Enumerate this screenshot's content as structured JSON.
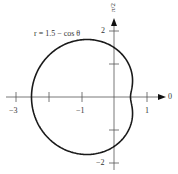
{
  "chart_data": {
    "type": "line",
    "title": "",
    "equation_label": "r = 1.5 − cos θ",
    "coordinate_system": "polar",
    "function": "r = 1.5 - cos(theta)",
    "theta_range": [
      0,
      6.283185
    ],
    "x_ticks": [
      -3,
      -2,
      -1,
      1
    ],
    "x_tick_labels": [
      "−3",
      "−1",
      "1"
    ],
    "x_tick_labels_positions": [
      -3,
      -1,
      1
    ],
    "y_ticks": [
      -2,
      -1,
      1,
      2
    ],
    "y_tick_labels": [
      "−2",
      "2"
    ],
    "y_tick_labels_positions": [
      -2,
      2
    ],
    "x_axis_end_label": "0",
    "y_axis_end_label": "π/2",
    "xlim": [
      -3.2,
      1.6
    ],
    "ylim": [
      -2.2,
      2.6
    ],
    "grid": false,
    "key_points": [
      {
        "theta": "0",
        "r": 0.5,
        "x": 0.5,
        "y": 0
      },
      {
        "theta": "π/2",
        "r": 1.5,
        "x": 0,
        "y": 1.5
      },
      {
        "theta": "π",
        "r": 2.5,
        "x": -2.5,
        "y": 0
      },
      {
        "theta": "3π/2",
        "r": 1.5,
        "x": 0,
        "y": -1.5
      }
    ],
    "line_color": "#1a1a1a",
    "axis_color": "#555555"
  },
  "labels": {
    "equation": "r = 1.5 − cos θ",
    "x_end": "0",
    "y_end": "π/2",
    "xt_m3": "−3",
    "xt_m1": "−1",
    "xt_1": "1",
    "yt_2": "2",
    "yt_m2": "−2"
  }
}
